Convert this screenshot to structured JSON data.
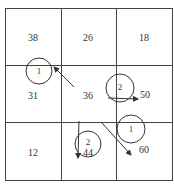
{
  "grid": {
    "rows": 3,
    "cols": 3,
    "cells": [
      {
        "row": 0,
        "col": 0,
        "value": "38"
      },
      {
        "row": 0,
        "col": 1,
        "value": "26"
      },
      {
        "row": 0,
        "col": 2,
        "value": "18"
      },
      {
        "row": 1,
        "col": 0,
        "value": "31"
      },
      {
        "row": 1,
        "col": 1,
        "value": "36"
      },
      {
        "row": 1,
        "col": 2,
        "value": "50"
      },
      {
        "row": 2,
        "col": 0,
        "value": "12"
      },
      {
        "row": 2,
        "col": 1,
        "value": "44"
      },
      {
        "row": 2,
        "col": 2,
        "value": "60"
      }
    ]
  },
  "circles": [
    {
      "label": "1",
      "note": "top-left of middle-left cell"
    },
    {
      "label": "2",
      "note": "middle-right boundary"
    },
    {
      "label": "1",
      "note": "bottom-right cell top"
    },
    {
      "label": "2",
      "note": "bottom-middle cell, around 44"
    }
  ],
  "arrows": [
    {
      "from": "36",
      "to": "circle 1 (left)"
    },
    {
      "from": "circle 2 (right)",
      "to": "50"
    },
    {
      "from": "center",
      "to": "60"
    },
    {
      "from": "circle 2 (bottom)",
      "direction": "down"
    }
  ]
}
